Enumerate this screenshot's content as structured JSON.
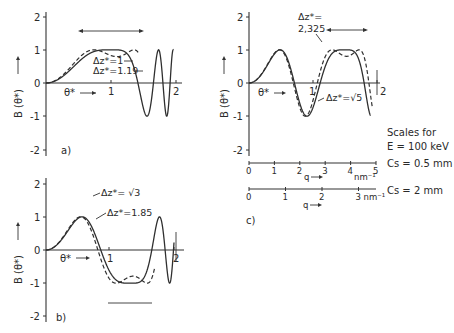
{
  "chart_data": [
    {
      "panel": "a)",
      "type": "line",
      "title": "",
      "xlabel": "θ*",
      "ylabel": "B (θ*)",
      "xlim": [
        0,
        2.05
      ],
      "ylim": [
        -2,
        2
      ],
      "xticks": [
        "1",
        "2"
      ],
      "yticks": [
        "2",
        "1",
        "0",
        "-1",
        "-2"
      ],
      "series": [
        {
          "name": "Δz* = 1",
          "style": "solid",
          "defocus": 1.0
        },
        {
          "name": "Δz* = 1.19",
          "style": "dashed",
          "defocus": 1.19
        }
      ],
      "annotations": [
        "Δz* = 1",
        "Δz* = 1.19",
        "band at B ≈ 1.6 (double arrow)"
      ]
    },
    {
      "panel": "b)",
      "type": "line",
      "title": "",
      "xlabel": "θ*",
      "ylabel": "B (θ*)",
      "xlim": [
        0,
        2.05
      ],
      "ylim": [
        -2,
        2
      ],
      "xticks": [
        "1",
        "2"
      ],
      "yticks": [
        "2",
        "1",
        "0",
        "-1",
        "-2"
      ],
      "series": [
        {
          "name": "Δz* = √3",
          "style": "solid",
          "defocus": 1.732
        },
        {
          "name": "Δz* = 1.85",
          "style": "dashed",
          "defocus": 1.85
        }
      ],
      "annotations": [
        "Δz* = √3",
        "Δz* = 1.85",
        "band at B ≈ -1.6"
      ]
    },
    {
      "panel": "c)",
      "type": "line",
      "title": "",
      "xlabel": "θ*",
      "ylabel": "B (θ*)",
      "xlim": [
        0,
        2.05
      ],
      "ylim": [
        -2,
        2
      ],
      "xticks": [
        "1",
        "2"
      ],
      "yticks": [
        "2",
        "1",
        "0",
        "-1",
        "-2"
      ],
      "series": [
        {
          "name": "Δz* = √5",
          "style": "solid",
          "defocus": 2.236
        },
        {
          "name": "Δz* = 2,325",
          "style": "dashed",
          "defocus": 2.325
        }
      ],
      "annotations": [
        "Δz* = 2,325",
        "Δz* = √5",
        "band at B ≈ 1.6 (double arrow)"
      ],
      "secondary_scales": [
        {
          "label": "Cs = 0.5 mm",
          "axis": "q",
          "unit": "nm⁻¹",
          "ticks": [
            "0",
            "1",
            "2",
            "3",
            "4",
            "5"
          ]
        },
        {
          "label": "Cs = 2 mm",
          "axis": "q",
          "unit": "nm⁻¹",
          "ticks": [
            "0",
            "1",
            "2",
            "3"
          ]
        }
      ],
      "scales_note": "Scales for E = 100 keV"
    }
  ],
  "labels": {
    "ylabel": "B (θ*)",
    "xlabel": "θ*",
    "panel_a": "a)",
    "panel_b": "b)",
    "panel_c": "c)",
    "a_dz1": "Δz*=1",
    "a_dz2": "Δz*=1.19",
    "b_dz1": "Δz*= √3",
    "b_dz2": "Δz*=1.85",
    "c_dz1_line1": "Δz*=",
    "c_dz1_line2": "2,325",
    "c_dz2": "Δz*=√5",
    "scales_line1": "Scales for",
    "scales_line2": "E = 100 keV",
    "cs1": "Cs = 0.5 mm",
    "cs2": "Cs = 2 mm",
    "q_label": "q",
    "nm_unit": "nm⁻¹",
    "q1_ticks": [
      "0",
      "1",
      "2",
      "3",
      "4",
      "5"
    ],
    "q2_ticks": [
      "0",
      "1",
      "2",
      "3 nm⁻¹"
    ],
    "y_ticks": [
      "2",
      "1",
      "0",
      "-1",
      "-2"
    ],
    "x_ticks": [
      "1",
      "2"
    ]
  }
}
